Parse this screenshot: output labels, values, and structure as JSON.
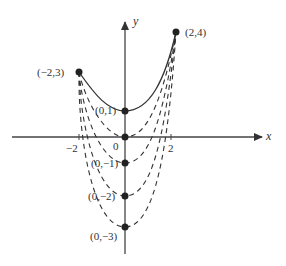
{
  "figure": {
    "axes": {
      "x_label": "x",
      "y_label": "y",
      "origin_label": "0",
      "x_ticks": [
        {
          "value": -2,
          "label": "−2"
        },
        {
          "value": 2,
          "label": "2"
        }
      ]
    },
    "points": [
      {
        "id": "p-2-4",
        "label": "(2,4)",
        "x": 2,
        "y": 4
      },
      {
        "id": "p-m2-3",
        "label": "(−2,3)",
        "x": -2,
        "y": 3
      },
      {
        "id": "p-0-1",
        "label": "(0,1)",
        "x": 0,
        "y": 1
      },
      {
        "id": "p-0-m1",
        "label": "(0,−1)",
        "x": 0,
        "y": -1
      },
      {
        "id": "p-0-m2",
        "label": "(0,−2)",
        "x": 0,
        "y": -2
      },
      {
        "id": "p-0-m3",
        "label": "(0,−3)",
        "x": 0,
        "y": -3
      }
    ],
    "curves": [
      {
        "style": "solid",
        "vertex": [
          0,
          1
        ],
        "description": "curve from (-2,3) through (0,1) to (2,4)"
      },
      {
        "style": "dashed",
        "vertex": [
          0,
          0
        ],
        "description": "curve shifted down 1"
      },
      {
        "style": "dashed",
        "vertex": [
          0,
          -1
        ],
        "description": "curve shifted down 2"
      },
      {
        "style": "dashed",
        "vertex": [
          0,
          -2
        ],
        "description": "curve shifted down 3"
      },
      {
        "style": "dashed",
        "vertex": [
          0,
          -3
        ],
        "description": "curve shifted down 4"
      }
    ],
    "colors": {
      "ink": "#333333",
      "background": "#ffffff"
    }
  }
}
